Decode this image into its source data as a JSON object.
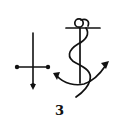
{
  "figure": {
    "label": "3",
    "symbols": [
      {
        "name": "cross",
        "description": "cross with dotted ends and arrow-tipped base"
      },
      {
        "name": "anchor",
        "description": "anchor with rope twined around shank"
      }
    ],
    "ink_color": "#111111",
    "background": "#ffffff"
  }
}
